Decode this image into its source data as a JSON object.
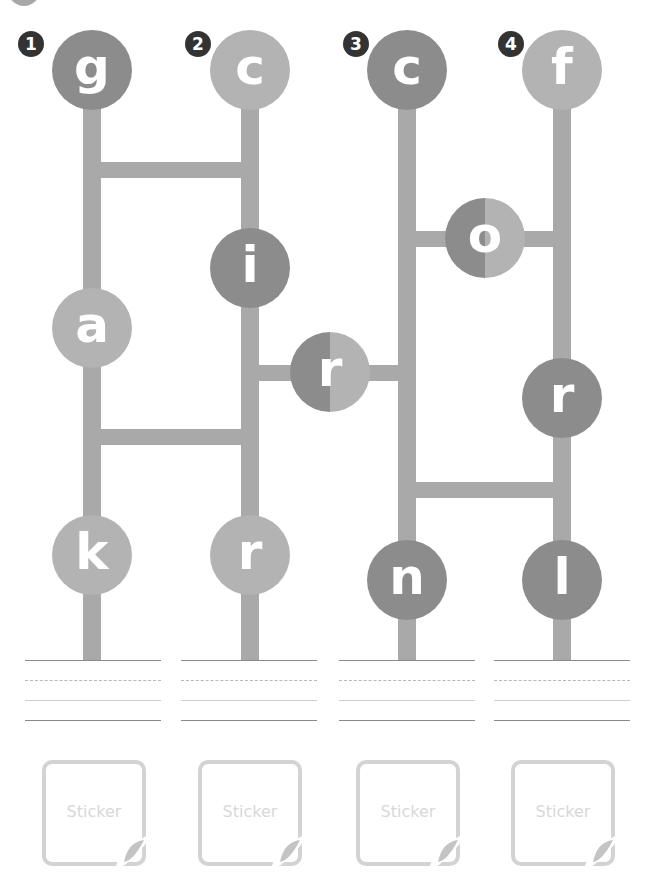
{
  "puzzle": {
    "type": "ladder-letter-game",
    "colors": {
      "rail": "#a9a9a9",
      "dark_node": "#8c8c8c",
      "light_node": "#b3b3b3",
      "badge": "#333333",
      "sticker_border": "#d3d3d3",
      "sticker_text": "#d8d8d8"
    },
    "columns": [
      {
        "number": "1",
        "top_letter": "g",
        "letters": [
          "a",
          "k"
        ]
      },
      {
        "number": "2",
        "top_letter": "c",
        "letters": [
          "i",
          "r"
        ]
      },
      {
        "number": "3",
        "top_letter": "c",
        "letters": [
          "n"
        ]
      },
      {
        "number": "4",
        "top_letter": "f",
        "letters": [
          "r",
          "l"
        ]
      }
    ],
    "bridge_nodes": [
      {
        "letter": "r",
        "between": "2-3"
      },
      {
        "letter": "o",
        "between": "3-4"
      }
    ],
    "stickers": [
      {
        "label": "Sticker"
      },
      {
        "label": "Sticker"
      },
      {
        "label": "Sticker"
      },
      {
        "label": "Sticker"
      }
    ]
  }
}
